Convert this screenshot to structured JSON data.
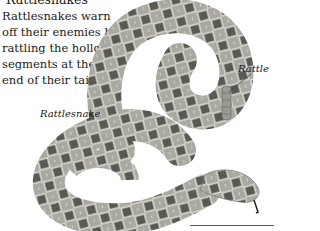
{
  "caption": {
    "cut_off_line": "Rattlesnakes",
    "text": "Rattlesnakes warn off their enemies by rattling the hollow segments at the end of their tails."
  },
  "labels": {
    "rattle": "Rattle",
    "snake": "Rattlesnake"
  },
  "illustration": {
    "subject": "coiled rattlesnake",
    "colors": {
      "body_light": "#b8b8b0",
      "body_mid": "#8a8a84",
      "diamond_dark": "#4a4a46",
      "leader_line": "#444444"
    }
  }
}
